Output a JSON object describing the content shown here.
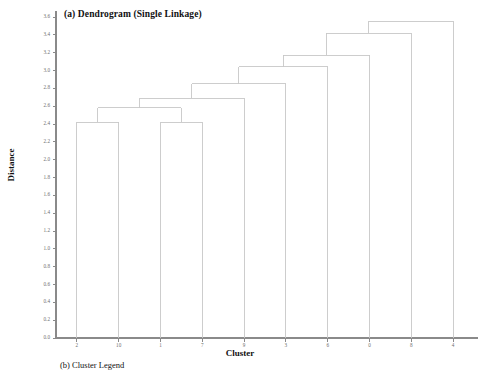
{
  "figure": {
    "panel_a_title": "(a) Dendrogram (Single Linkage)",
    "panel_b_caption": "(b) Cluster Legend"
  },
  "axes": {
    "x_title": "Cluster",
    "y_title": "Distance"
  },
  "colors": {
    "link": "#c8c8c8",
    "axis": "#8a8a8a",
    "tick_text": "#6e6e6e",
    "title_text": "#111111",
    "background": "#ffffff"
  },
  "chart_data": {
    "type": "line",
    "subtype": "dendrogram",
    "title": "(a) Dendrogram (Single Linkage)",
    "xlabel": "Cluster",
    "ylabel": "Distance",
    "linkage_method": "single",
    "grid": false,
    "legend": "none",
    "ylim": [
      0.0,
      3.6
    ],
    "ytick_labels": [
      "0.0",
      "0.2",
      "0.4",
      "0.6",
      "0.8",
      "1.0",
      "1.2",
      "1.4",
      "1.6",
      "1.8",
      "2.0",
      "2.2",
      "2.4",
      "2.6",
      "2.8",
      "3.0",
      "3.2",
      "3.4",
      "3.6"
    ],
    "ytick_values": [
      0.0,
      0.2,
      0.4,
      0.6,
      0.8,
      1.0,
      1.2,
      1.4,
      1.6,
      1.8,
      2.0,
      2.2,
      2.4,
      2.6,
      2.8,
      3.0,
      3.2,
      3.4,
      3.6
    ],
    "leaf_labels": [
      "2",
      "10",
      "1",
      "7",
      "9",
      "3",
      "6",
      "0",
      "8",
      "4"
    ],
    "leaf_positions": [
      1,
      2,
      3,
      4,
      5,
      6,
      7,
      8,
      9,
      10
    ],
    "merges": [
      {
        "id": "m1",
        "left": "2",
        "right": "10",
        "height": 2.42,
        "x_left": 1.0,
        "x_right": 2.0
      },
      {
        "id": "m2",
        "left": "1",
        "right": "7",
        "height": 2.42,
        "x_left": 3.0,
        "x_right": 4.0
      },
      {
        "id": "m3",
        "left": "m1",
        "right": "m2",
        "height": 2.58,
        "x_left": 1.5,
        "x_right": 3.5
      },
      {
        "id": "m4",
        "left": "m3",
        "right": "9",
        "height": 2.69,
        "x_left": 2.5,
        "x_right": 5.0
      },
      {
        "id": "m5",
        "left": "m4",
        "right": "3",
        "height": 2.85,
        "x_left": 3.75,
        "x_right": 6.0
      },
      {
        "id": "m6",
        "left": "m5",
        "right": "6",
        "height": 3.04,
        "x_left": 4.875,
        "x_right": 7.0
      },
      {
        "id": "m7",
        "left": "m6",
        "right": "0",
        "height": 3.17,
        "x_left": 5.94,
        "x_right": 8.0
      },
      {
        "id": "m8",
        "left": "m7",
        "right": "8",
        "height": 3.42,
        "x_left": 6.97,
        "x_right": 9.0
      },
      {
        "id": "m9",
        "left": "m8",
        "right": "4",
        "height": 3.55,
        "x_left": 7.98,
        "x_right": 10.0
      }
    ]
  }
}
